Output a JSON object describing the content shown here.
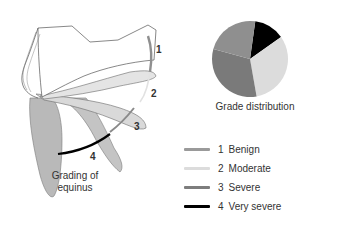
{
  "figure": {
    "left_panel": {
      "caption_line1": "Grading of",
      "caption_line2": "equinus",
      "grade_labels": [
        "1",
        "2",
        "3",
        "4"
      ]
    },
    "right_panel": {
      "caption": "Grade distribution"
    },
    "legend": {
      "items": [
        {
          "num": "1",
          "label": "Benign",
          "color": "#9a9a9a"
        },
        {
          "num": "2",
          "label": "Moderate",
          "color": "#dcdcdc"
        },
        {
          "num": "3",
          "label": "Severe",
          "color": "#7d7d7d"
        },
        {
          "num": "4",
          "label": "Very severe",
          "color": "#000000"
        }
      ]
    },
    "colors": {
      "outline": "#555555",
      "foot_light": "#e6e6e6",
      "foot_mid": "#d2d2d2",
      "foot_dark": "#b8b8b8",
      "foot_white": "#ffffff"
    }
  },
  "chart_data": {
    "type": "pie",
    "title": "Grade distribution",
    "categories": [
      "1 Benign",
      "2 Moderate",
      "3 Severe",
      "4 Very severe"
    ],
    "values": [
      23,
      32,
      32,
      13
    ],
    "colors": [
      "#8f8f8f",
      "#dcdcdc",
      "#7a7a7a",
      "#000000"
    ],
    "start_angle_deg": 8,
    "direction": "clockwise_order_4_2_3_1",
    "legend_position": "below"
  }
}
